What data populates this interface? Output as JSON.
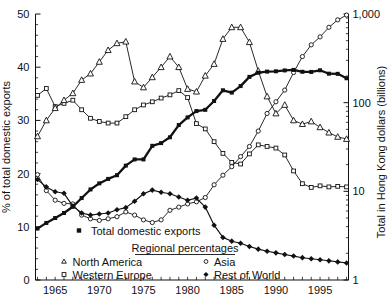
{
  "chart_data": {
    "type": "line",
    "title": "",
    "years": [
      1963,
      1964,
      1965,
      1966,
      1967,
      1968,
      1969,
      1970,
      1971,
      1972,
      1973,
      1974,
      1975,
      1976,
      1977,
      1978,
      1979,
      1980,
      1981,
      1982,
      1983,
      1984,
      1985,
      1986,
      1987,
      1988,
      1989,
      1990,
      1991,
      1992,
      1993,
      1994,
      1995,
      1996,
      1997,
      1998
    ],
    "x_axis": {
      "tick_year_start": 1963,
      "tick_year_end": 1998,
      "label_years": [
        1965,
        1970,
        1975,
        1980,
        1985,
        1990,
        1995
      ],
      "labels": [
        "1965",
        "1970",
        "1975",
        "1980",
        "1985",
        "1990",
        "1995"
      ]
    },
    "y_left": {
      "title": "% of total domestic exports",
      "min": 0,
      "max": 50,
      "tick_values": [
        0,
        10,
        20,
        30,
        40,
        50
      ],
      "tick_labels": [
        "0",
        "10",
        "20",
        "30",
        "40",
        "50"
      ],
      "minor_step": 2
    },
    "y_right": {
      "title": "Total in Hong Kong dollars (billions)",
      "scale": "log",
      "tick_values": [
        1,
        10,
        100,
        1000
      ],
      "tick_labels": [
        "1",
        "10",
        "100",
        "1,000"
      ],
      "minor_multiples": [
        2,
        3,
        4,
        5,
        6,
        7,
        8,
        9
      ]
    },
    "grid": false,
    "legend_position": "inside-bottom-left",
    "series": [
      {
        "name": "Total domestic exports",
        "axis": "right-log",
        "marker": "filled-square",
        "line_width": 2.3,
        "values": [
          3.8,
          4.4,
          5.0,
          5.7,
          6.7,
          8.4,
          10.5,
          12.3,
          13.8,
          15.2,
          19.5,
          22.9,
          22.9,
          32.6,
          35.0,
          40.7,
          55.9,
          68.2,
          80.4,
          83.0,
          104.4,
          137.9,
          129.9,
          153.9,
          195.3,
          217.7,
          224.1,
          225.9,
          231.0,
          234.1,
          223.0,
          222.1,
          231.7,
          212.2,
          211.4,
          188.5
        ]
      },
      {
        "name": "North America",
        "axis": "left-percent",
        "marker": "open-triangle",
        "line_width": 0.9,
        "values": [
          27.0,
          30.0,
          32.3,
          33.8,
          35.1,
          37.6,
          38.8,
          41.0,
          43.2,
          44.5,
          44.8,
          37.3,
          36.2,
          38.1,
          40.0,
          42.0,
          40.0,
          35.9,
          35.4,
          38.4,
          40.6,
          45.3,
          47.5,
          47.5,
          44.7,
          39.3,
          34.5,
          31.3,
          32.9,
          30.0,
          29.3,
          29.8,
          28.7,
          27.7,
          26.9,
          26.5
        ]
      },
      {
        "name": "Western Europe",
        "axis": "left-percent",
        "marker": "open-square",
        "line_width": 0.9,
        "values": [
          34.7,
          36.0,
          32.6,
          33.2,
          33.8,
          32.0,
          30.4,
          29.8,
          29.5,
          29.5,
          30.7,
          32.0,
          32.9,
          33.5,
          34.2,
          34.8,
          35.6,
          34.3,
          29.4,
          28.4,
          26.0,
          23.8,
          22.1,
          21.8,
          23.7,
          25.4,
          25.1,
          24.8,
          23.5,
          20.5,
          18.1,
          17.4,
          17.7,
          17.5,
          17.6,
          17.5
        ]
      },
      {
        "name": "Asia",
        "axis": "left-percent",
        "marker": "open-circle",
        "line_width": 0.9,
        "values": [
          19.8,
          16.8,
          15.0,
          14.4,
          14.3,
          12.2,
          11.5,
          11.2,
          11.5,
          11.9,
          12.8,
          12.2,
          11.3,
          10.8,
          11.3,
          13.1,
          13.7,
          14.3,
          14.7,
          15.5,
          17.9,
          19.7,
          21.3,
          23.2,
          25.1,
          28.0,
          31.3,
          33.5,
          35.7,
          39.0,
          42.0,
          44.2,
          45.7,
          47.5,
          48.9,
          49.8
        ]
      },
      {
        "name": "Rest of World",
        "axis": "left-percent",
        "marker": "filled-diamond",
        "line_width": 1.15,
        "values": [
          18.9,
          17.5,
          16.6,
          16.3,
          13.9,
          12.6,
          12.2,
          12.4,
          12.6,
          13.2,
          13.6,
          14.8,
          16.2,
          16.9,
          16.5,
          16.2,
          15.6,
          15.0,
          15.4,
          13.7,
          10.3,
          8.0,
          7.3,
          6.9,
          6.3,
          5.8,
          5.4,
          5.1,
          4.8,
          4.5,
          4.2,
          4.0,
          3.8,
          3.6,
          3.4,
          3.2
        ]
      }
    ],
    "legend": {
      "total_row": {
        "label": "Total domestic exports",
        "marker": "filled-square"
      },
      "group_title": "Regional percentages",
      "items": [
        {
          "label": "North America",
          "marker": "open-triangle"
        },
        {
          "label": "Western Europe",
          "marker": "open-square"
        },
        {
          "label": "Asia",
          "marker": "open-circle"
        },
        {
          "label": "Rest of World",
          "marker": "filled-diamond"
        }
      ]
    },
    "colors": {
      "ink": "#111111",
      "background": "#ffffff"
    }
  }
}
